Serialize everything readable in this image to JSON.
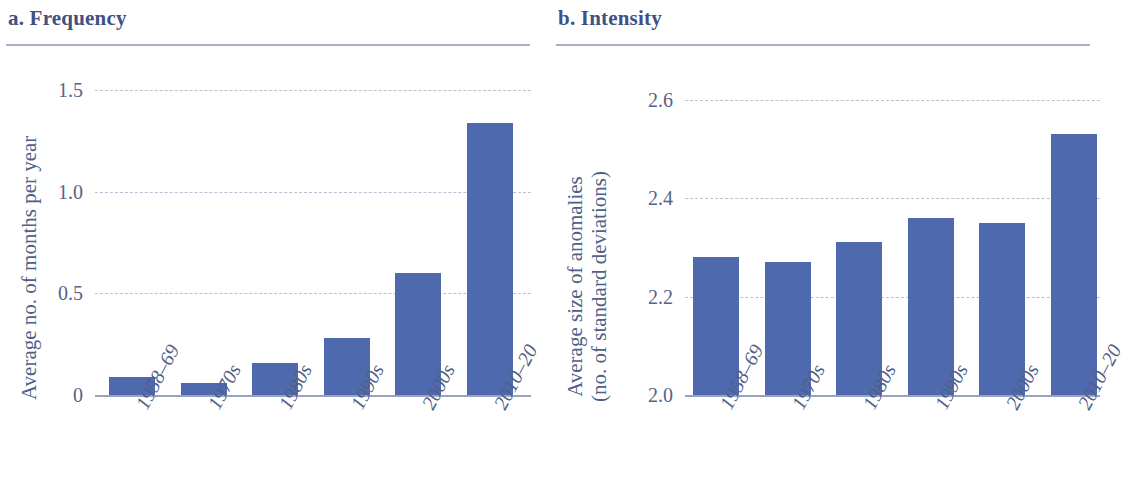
{
  "figure": {
    "panels": [
      {
        "key": "a",
        "title": "a. Frequency",
        "ylabel": "Average no. of months per year",
        "ylabel_lines": [
          "Average no. of months per year"
        ]
      },
      {
        "key": "b",
        "title": "b. Intensity",
        "ylabel": "Average size of anomalies (no. of standard deviations)",
        "ylabel_lines": [
          "Average size of anomalies",
          "(no. of standard deviations)"
        ]
      }
    ],
    "colors": {
      "bar": "#4f69ae",
      "title": "#3f5182",
      "tick_label": "#556388",
      "gridline": "#b9c0d3",
      "axis_line": "#9aa3bd",
      "rule": "#a8b0c8"
    }
  },
  "chart_data": [
    {
      "type": "bar",
      "panel": "a",
      "title": "a. Frequency",
      "xlabel": "",
      "ylabel": "Average no. of months per year",
      "categories": [
        "1958–69",
        "1970s",
        "1980s",
        "1990s",
        "2000s",
        "2010–20"
      ],
      "values": [
        0.09,
        0.06,
        0.16,
        0.28,
        0.6,
        1.34
      ],
      "ylim": [
        0,
        1.6
      ],
      "yticks": [
        0,
        0.5,
        1.0,
        1.5
      ],
      "ytick_labels": [
        "0",
        "0.5",
        "1.0",
        "1.5"
      ],
      "grid": "horizontal-dashed",
      "legend": "none"
    },
    {
      "type": "bar",
      "panel": "b",
      "title": "b. Intensity",
      "xlabel": "",
      "ylabel": "Average size of anomalies (no. of standard deviations)",
      "categories": [
        "1958–69",
        "1970s",
        "1980s",
        "1990s",
        "2000s",
        "2010–20"
      ],
      "values": [
        2.28,
        2.27,
        2.31,
        2.36,
        2.35,
        2.53
      ],
      "ylim": [
        2.0,
        2.66
      ],
      "yticks": [
        2.0,
        2.2,
        2.4,
        2.6
      ],
      "ytick_labels": [
        "2.0",
        "2.2",
        "2.4",
        "2.6"
      ],
      "grid": "horizontal-dashed",
      "legend": "none"
    }
  ]
}
